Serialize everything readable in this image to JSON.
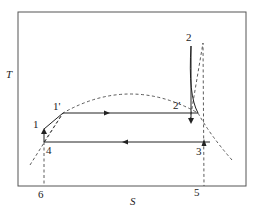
{
  "diagram": {
    "type": "T-S diagram",
    "axes": {
      "y_label": "T",
      "x_label": "S"
    },
    "points": [
      {
        "id": "1",
        "label": "1"
      },
      {
        "id": "1p",
        "label": "1'"
      },
      {
        "id": "2",
        "label": "2"
      },
      {
        "id": "2p",
        "label": "2'"
      },
      {
        "id": "3",
        "label": "3"
      },
      {
        "id": "4",
        "label": "4"
      },
      {
        "id": "5",
        "label": "5"
      },
      {
        "id": "6",
        "label": "6"
      }
    ],
    "colors": {
      "line": "#222222",
      "frame": "#555555",
      "background": "#ffffff"
    }
  }
}
